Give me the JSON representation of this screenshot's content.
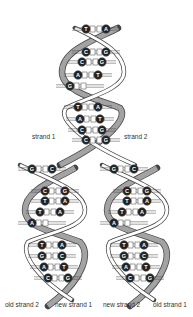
{
  "diagram": {
    "colors": {
      "backbone_dark": "#9a9a9a",
      "backbone_light": "#ffffff",
      "outline": "#444444",
      "base_fill": "#222222",
      "base_text": "#ffffff",
      "rung": "#ffffff"
    },
    "labels": {
      "strand1": "strand 1",
      "strand2": "strand 2",
      "old_strand_2": "old strand 2",
      "new_strand_1": "new strand 1",
      "new_strand_2": "new strand 2",
      "old_strand_1": "old strand 1"
    },
    "parent_pairs": [
      {
        "left": "T",
        "right": "A",
        "x": 96,
        "y": 29
      },
      {
        "left": "C",
        "right": "G",
        "x": 96,
        "y": 52
      },
      {
        "left": "C",
        "right": "G",
        "x": 92,
        "y": 62
      },
      {
        "left": "A",
        "right": "T",
        "x": 88,
        "y": 75
      },
      {
        "left": "G",
        "right": "",
        "x": 80,
        "y": 86
      },
      {
        "left": "T",
        "right": "A",
        "x": 88,
        "y": 107
      },
      {
        "left": "A",
        "right": "T",
        "x": 90,
        "y": 119
      },
      {
        "left": "C",
        "right": "G",
        "x": 92,
        "y": 130
      },
      {
        "left": "C",
        "right": "G",
        "x": 96,
        "y": 140
      }
    ],
    "left_daughter_pairs": [
      {
        "left": "G",
        "right": "C",
        "x": 42,
        "y": 169
      },
      {
        "left": "C",
        "right": "G",
        "x": 55,
        "y": 191
      },
      {
        "left": "T",
        "right": "A",
        "x": 55,
        "y": 201
      },
      {
        "left": "T",
        "right": "A",
        "x": 50,
        "y": 212
      },
      {
        "left": "A",
        "right": "",
        "x": 42,
        "y": 223
      },
      {
        "left": "T",
        "right": "A",
        "x": 52,
        "y": 245
      },
      {
        "left": "G",
        "right": "C",
        "x": 52,
        "y": 256
      },
      {
        "left": "A",
        "right": "T",
        "x": 54,
        "y": 267
      },
      {
        "left": "C",
        "right": "G",
        "x": 58,
        "y": 278
      }
    ],
    "right_daughter_pairs": [
      {
        "left": "G",
        "right": "C",
        "x": 124,
        "y": 169
      },
      {
        "left": "C",
        "right": "G",
        "x": 137,
        "y": 191
      },
      {
        "left": "T",
        "right": "A",
        "x": 137,
        "y": 201
      },
      {
        "left": "T",
        "right": "A",
        "x": 132,
        "y": 212
      },
      {
        "left": "A",
        "right": "",
        "x": 124,
        "y": 223
      },
      {
        "left": "T",
        "right": "A",
        "x": 134,
        "y": 245
      },
      {
        "left": "G",
        "right": "C",
        "x": 134,
        "y": 256
      },
      {
        "left": "A",
        "right": "T",
        "x": 136,
        "y": 267
      },
      {
        "left": "C",
        "right": "G",
        "x": 140,
        "y": 278
      }
    ]
  }
}
